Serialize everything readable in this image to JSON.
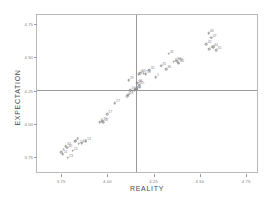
{
  "chart_data": {
    "type": "scatter",
    "title": "",
    "xlabel": "REALITY",
    "ylabel": "EXPECTATION",
    "xlim": [
      3.62,
      4.82
    ],
    "ylim": [
      3.62,
      4.82
    ],
    "grid": false,
    "legend": null,
    "xticks": [
      "3.75",
      "4.00",
      "4.25",
      "4.50",
      "4.75"
    ],
    "xtick_values": [
      3.75,
      4.0,
      4.25,
      4.5,
      4.75
    ],
    "yticks": [
      "3.75",
      "4.00",
      "4.25",
      "4.50",
      "4.75"
    ],
    "ytick_values": [
      3.75,
      4.0,
      4.25,
      4.5,
      4.75
    ],
    "reference_lines": {
      "vertical_x": 4.155,
      "horizontal_y": 4.255
    },
    "marker": "open-circle",
    "point_labels_shown": true,
    "points": [
      {
        "label": "8",
        "x": 3.752,
        "y": 3.783
      },
      {
        "label": "11",
        "x": 3.758,
        "y": 3.768
      },
      {
        "label": "23",
        "x": 3.787,
        "y": 3.742
      },
      {
        "label": "33",
        "x": 3.776,
        "y": 3.828
      },
      {
        "label": "30",
        "x": 3.783,
        "y": 3.82
      },
      {
        "label": "21",
        "x": 3.812,
        "y": 3.795
      },
      {
        "label": "4",
        "x": 3.826,
        "y": 3.866
      },
      {
        "label": "9",
        "x": 3.829,
        "y": 3.872
      },
      {
        "label": "24",
        "x": 3.845,
        "y": 3.849
      },
      {
        "label": "14",
        "x": 3.861,
        "y": 3.853
      },
      {
        "label": "13",
        "x": 3.884,
        "y": 3.866
      },
      {
        "label": "6",
        "x": 3.958,
        "y": 4.012
      },
      {
        "label": "15",
        "x": 3.972,
        "y": 4.018
      },
      {
        "label": "22",
        "x": 3.978,
        "y": 4.01
      },
      {
        "label": "17",
        "x": 3.999,
        "y": 4.072
      },
      {
        "label": "27",
        "x": 4.041,
        "y": 4.155
      },
      {
        "label": "5",
        "x": 4.107,
        "y": 4.205
      },
      {
        "label": "28",
        "x": 4.112,
        "y": 4.218
      },
      {
        "label": "10",
        "x": 4.123,
        "y": 4.252
      },
      {
        "label": "31",
        "x": 4.138,
        "y": 4.25
      },
      {
        "label": "2",
        "x": 4.148,
        "y": 4.253
      },
      {
        "label": "19",
        "x": 4.152,
        "y": 4.256
      },
      {
        "label": "34",
        "x": 4.155,
        "y": 4.259
      },
      {
        "label": "3",
        "x": 4.16,
        "y": 4.262
      },
      {
        "label": "26",
        "x": 4.158,
        "y": 4.3
      },
      {
        "label": "16",
        "x": 4.163,
        "y": 4.31
      },
      {
        "label": "25",
        "x": 4.172,
        "y": 4.294
      },
      {
        "label": "29",
        "x": 4.115,
        "y": 4.33
      },
      {
        "label": "20",
        "x": 4.17,
        "y": 4.372
      },
      {
        "label": "12",
        "x": 4.178,
        "y": 4.382
      },
      {
        "label": "7",
        "x": 4.196,
        "y": 4.378
      },
      {
        "label": "18",
        "x": 4.207,
        "y": 4.374
      },
      {
        "label": "32",
        "x": 4.228,
        "y": 4.404
      },
      {
        "label": "1",
        "x": 4.262,
        "y": 4.352
      },
      {
        "label": "35",
        "x": 4.291,
        "y": 4.438
      },
      {
        "label": "36",
        "x": 4.317,
        "y": 4.41
      },
      {
        "label": "37",
        "x": 4.358,
        "y": 4.468
      },
      {
        "label": "38",
        "x": 4.372,
        "y": 4.474
      },
      {
        "label": "39",
        "x": 4.381,
        "y": 4.462
      },
      {
        "label": "40",
        "x": 4.387,
        "y": 4.455
      },
      {
        "label": "41",
        "x": 4.332,
        "y": 4.528
      },
      {
        "label": "42",
        "x": 4.536,
        "y": 4.598
      },
      {
        "label": "43",
        "x": 4.552,
        "y": 4.562
      },
      {
        "label": "44",
        "x": 4.571,
        "y": 4.578
      },
      {
        "label": "45",
        "x": 4.589,
        "y": 4.556
      },
      {
        "label": "46",
        "x": 4.548,
        "y": 4.684
      },
      {
        "label": "47",
        "x": 4.563,
        "y": 4.648
      }
    ]
  }
}
